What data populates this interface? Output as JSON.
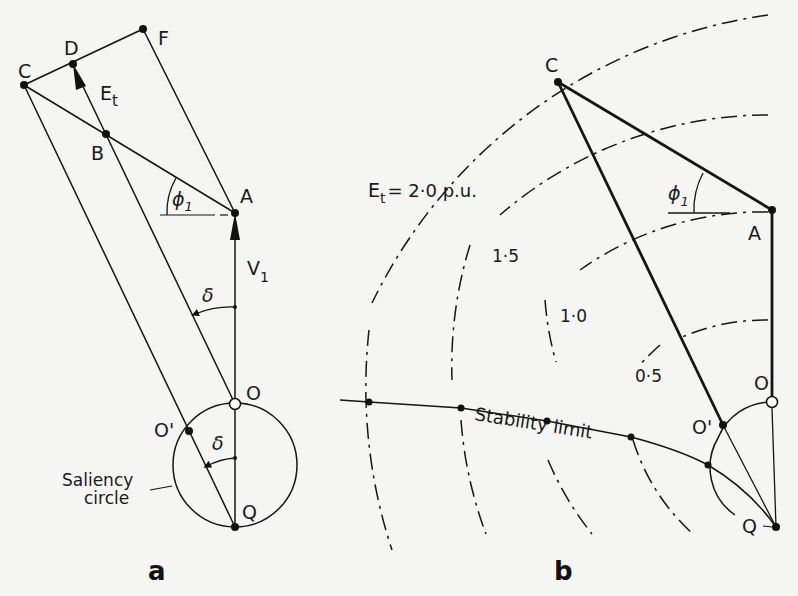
{
  "panel_a": {
    "caption": "a",
    "points": {
      "C": {
        "label": "C",
        "x": 24,
        "y": 85
      },
      "D": {
        "label": "D",
        "x": 73,
        "y": 64
      },
      "F": {
        "label": "F",
        "x": 143,
        "y": 29
      },
      "B": {
        "label": "B",
        "x": 106,
        "y": 134
      },
      "A": {
        "label": "A",
        "x": 235,
        "y": 213
      },
      "O": {
        "label": "O",
        "x": 235,
        "y": 404
      },
      "O_prime": {
        "label": "O'",
        "x": 189,
        "y": 431
      },
      "Q": {
        "label": "Q",
        "x": 235,
        "y": 527
      }
    },
    "vectors": {
      "Et": {
        "label": "E",
        "sub": "t"
      },
      "V1": {
        "label": "V",
        "sub": "1"
      }
    },
    "angles": {
      "phi1": {
        "label": "ϕ",
        "sub": "1"
      },
      "delta_upper": {
        "label": "δ"
      },
      "delta_lower": {
        "label": "δ"
      }
    },
    "saliency_label_line1": "Saliency",
    "saliency_label_line2": "circle"
  },
  "panel_b": {
    "caption": "b",
    "points": {
      "C": {
        "label": "C",
        "x": 558,
        "y": 82
      },
      "A": {
        "label": "A",
        "x": 772,
        "y": 210
      },
      "O": {
        "label": "O",
        "x": 772,
        "y": 402
      },
      "O_prime": {
        "label": "O'",
        "x": 723,
        "y": 425
      },
      "Q": {
        "label": "Q",
        "x": 776,
        "y": 527
      }
    },
    "angle_phi1": {
      "label": "ϕ",
      "sub": "1"
    },
    "et_label_main": "E",
    "et_label_sub": "t",
    "et_label_rest": "= 2·0  p.u.",
    "contour_labels": [
      "1·5",
      "1·0",
      "0·5"
    ],
    "stability_label": "Stability limit"
  }
}
